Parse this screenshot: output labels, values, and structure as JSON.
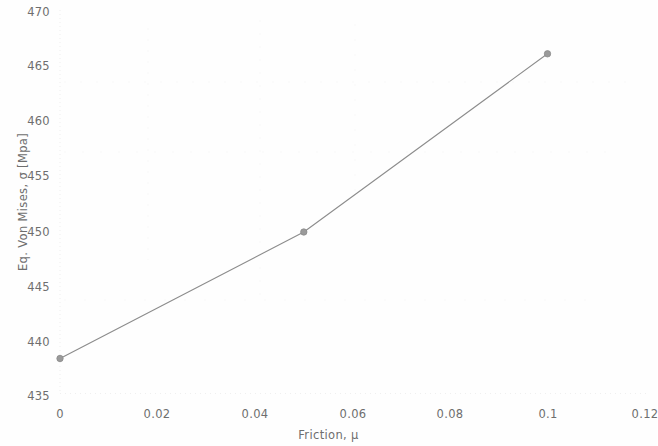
{
  "chart_data": {
    "type": "line",
    "title": "",
    "subtitle": "",
    "xlabel": "Friction, μ",
    "ylabel": "Eq. Von Mises, σ [Mpa]",
    "x": [
      0,
      0.05,
      0.1
    ],
    "values": [
      438.5,
      450.0,
      466.2
    ],
    "series": [
      {
        "name": "Eq. Von Mises stress",
        "x": [
          0,
          0.05,
          0.1
        ],
        "values": [
          438.5,
          450.0,
          466.2
        ]
      }
    ],
    "xlim": [
      0,
      0.12
    ],
    "ylim": [
      435,
      470
    ],
    "xticks": [
      0,
      0.02,
      0.04,
      0.06,
      0.08,
      0.1,
      0.12
    ],
    "xtick_labels": [
      "0",
      "0.02",
      "0.04",
      "0.06",
      "0.08",
      "0.1",
      "0.12"
    ],
    "yticks": [
      435,
      440,
      445,
      450,
      455,
      460,
      465,
      470
    ],
    "ytick_labels": [
      "435",
      "440",
      "445",
      "450",
      "455",
      "460",
      "465",
      "470"
    ],
    "grid": false,
    "legend": false,
    "legend_position": "none",
    "marker": "circle",
    "line_color": "#8c8c8c",
    "marker_color": "#9a9a9a",
    "axis_color": "#d8d8d8",
    "background_color": "#fefefe",
    "text_color": "#6e6e6e",
    "annotations": []
  }
}
